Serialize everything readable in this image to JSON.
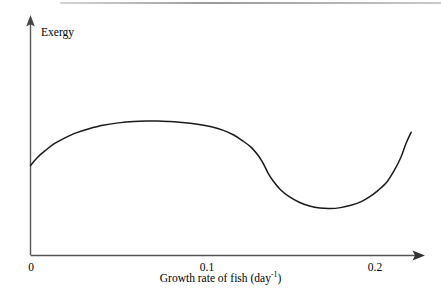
{
  "chart_data": {
    "type": "line",
    "title": "",
    "subtitle": "",
    "xlabel_text": "Growth rate of fish (day",
    "xlabel_sup": "-1",
    "xlabel_tail": ")",
    "xlabel_full": "Growth rate of fish (day-1)",
    "ylabel": "Exergy",
    "xticks": [
      "0",
      "0.1",
      "0.2"
    ],
    "xtick_values": [
      0,
      0.1,
      0.2
    ],
    "yticks": [],
    "xlim": [
      0,
      0.223
    ],
    "ylim": [
      0,
      1
    ],
    "grid": false,
    "legend": "none",
    "axis_style": "arrow-ended open axes, no tick marks, no y tick labels",
    "annotations": [],
    "series": [
      {
        "name": "Exergy vs growth rate of fish",
        "description": "Rises steeply from the axis, broad flat maximum near 0.04-0.09, gradual decline then an abrupt near-vertical drop around 0.135, shallow minimum near 0.167, then a steep rise toward the right edge.",
        "x": [
          0.0,
          0.004,
          0.009,
          0.014,
          0.02,
          0.026,
          0.034,
          0.042,
          0.051,
          0.06,
          0.068,
          0.074,
          0.08,
          0.088,
          0.097,
          0.105,
          0.112,
          0.118,
          0.123,
          0.128,
          0.132,
          0.134,
          0.136,
          0.138,
          0.141,
          0.145,
          0.15,
          0.156,
          0.162,
          0.168,
          0.174,
          0.18,
          0.186,
          0.192,
          0.197,
          0.202,
          0.207,
          0.211,
          0.215,
          0.218,
          0.221
        ],
        "y": [
          0.385,
          0.42,
          0.452,
          0.48,
          0.504,
          0.524,
          0.543,
          0.558,
          0.568,
          0.574,
          0.576,
          0.576,
          0.574,
          0.57,
          0.562,
          0.551,
          0.536,
          0.516,
          0.492,
          0.464,
          0.43,
          0.408,
          0.382,
          0.352,
          0.318,
          0.283,
          0.253,
          0.228,
          0.212,
          0.203,
          0.201,
          0.205,
          0.215,
          0.231,
          0.252,
          0.28,
          0.316,
          0.362,
          0.42,
          0.48,
          0.528
        ]
      }
    ]
  },
  "figure": {
    "ylabel": "Exergy",
    "xlabel_prefix": "Growth rate of fish (day",
    "xlabel_superscript": "-1",
    "xlabel_suffix": ")",
    "ticks": {
      "t0": "0",
      "t1": "0.1",
      "t2": "0.2"
    },
    "colors": {
      "curve": "#1a1a1a",
      "axis": "#4d4d4d",
      "background": "#ffffff",
      "text": "#000000"
    }
  }
}
